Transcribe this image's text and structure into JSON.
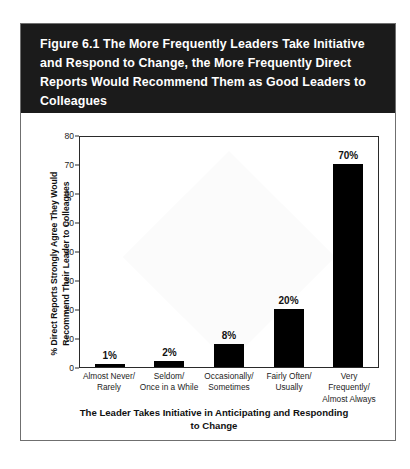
{
  "figure": {
    "title": "Figure 6.1  The More Frequently Leaders Take Initiative and Respond to Change, the More Frequently Direct Reports Would Recommend Them as Good Leaders to Colleagues",
    "title_band_color": "#1b1b1b",
    "title_text_color": "#ffffff",
    "bar_color": "#000000",
    "frame_color": "#6f6f6f"
  },
  "chart_data": {
    "type": "bar",
    "title": "Figure 6.1  The More Frequently Leaders Take Initiative and Respond to Change, the More Frequently Direct Reports Would Recommend Them as Good Leaders to Colleagues",
    "categories": [
      "Almost Never/\nRarely",
      "Seldom/\nOnce in a While",
      "Occasionally/\nSometimes",
      "Fairly Often/\nUsually",
      "Very Frequently/\nAlmost Always"
    ],
    "values": [
      1,
      2,
      8,
      20,
      70
    ],
    "value_labels": [
      "1%",
      "2%",
      "8%",
      "20%",
      "70%"
    ],
    "xlabel": "The Leader Takes Initiative in Anticipating and Responding\nto Change",
    "ylabel": "% Direct Reports Strongly Agree They Would\nRecommend Their Leader to Colleagues",
    "ylim": [
      0,
      80
    ],
    "yticks": [
      0,
      10,
      20,
      30,
      40,
      50,
      60,
      70,
      80
    ],
    "ytick_labels": [
      "0",
      "10",
      "20",
      "30",
      "40",
      "50",
      "60",
      "70",
      "80"
    ],
    "grid": false,
    "legend": null,
    "series": [
      {
        "name": "% Direct Reports Strongly Agree They Would Recommend Their Leader to Colleagues",
        "values": [
          1,
          2,
          8,
          20,
          70
        ]
      }
    ]
  }
}
